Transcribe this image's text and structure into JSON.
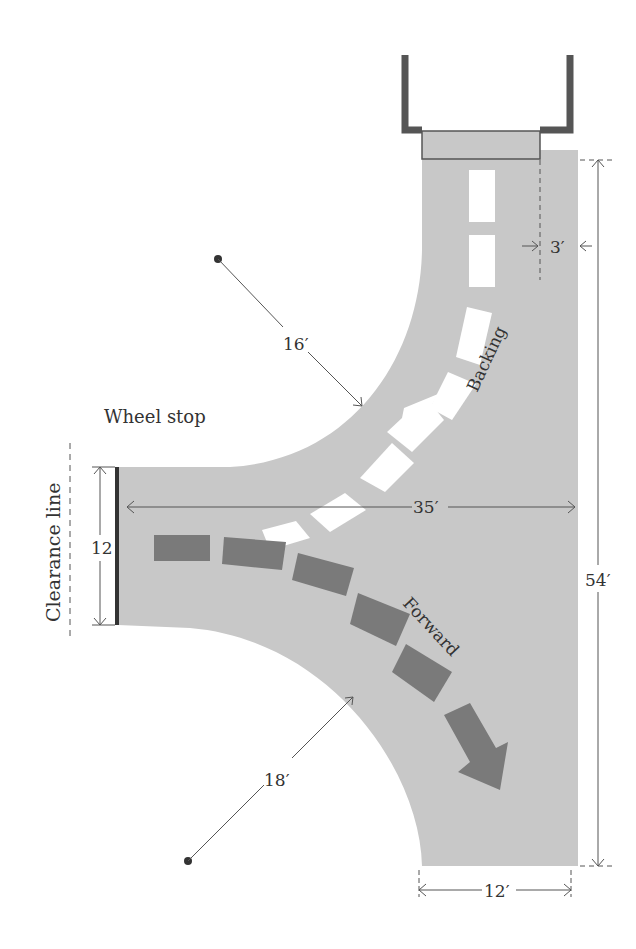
{
  "diagram": {
    "type": "driveway-turnaround-plan",
    "colors": {
      "pavement": "#c8c8c8",
      "background": "#ffffff",
      "garage_wall": "#555555",
      "backing_arrow": "#ffffff",
      "forward_arrow": "#7a7a7a",
      "dimension_line": "#555555",
      "text": "#333333"
    },
    "labels": {
      "wheel_stop": "Wheel stop",
      "clearance_line": "Clearance line",
      "backing": "Backing",
      "forward": "Forward"
    },
    "dimensions": {
      "inner_radius_upper": "16′",
      "inner_radius_lower": "18′",
      "garage_offset": "3′",
      "turnaround_depth": "35′",
      "overall_length": "54′",
      "driveway_width": "12′",
      "stall_width": "12"
    }
  }
}
